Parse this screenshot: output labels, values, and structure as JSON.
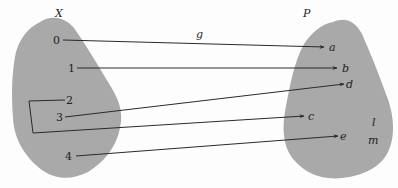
{
  "diagram": {
    "type": "function-mapping",
    "domain_set": {
      "label": "X",
      "elements": [
        "0",
        "1",
        "2",
        "3",
        "4"
      ]
    },
    "codomain_set": {
      "label": "P",
      "elements": [
        "a",
        "b",
        "d",
        "c",
        "e",
        "l",
        "m"
      ]
    },
    "function_label": "g",
    "mappings": [
      {
        "from": "0",
        "to": "a"
      },
      {
        "from": "1",
        "to": "b"
      },
      {
        "from": "2",
        "to": "c"
      },
      {
        "from": "3",
        "to": "d"
      },
      {
        "from": "4",
        "to": "e"
      }
    ],
    "colors": {
      "blob_fill": "#a9a9a9",
      "line": "#2a2a2a",
      "text": "#222222"
    }
  }
}
